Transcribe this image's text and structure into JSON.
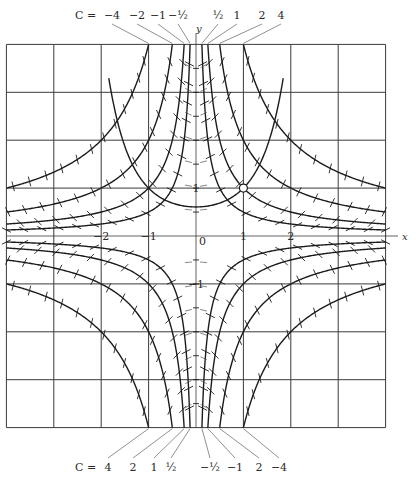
{
  "figure": {
    "colors": {
      "ink": "#1c1c1c",
      "grid": "#3a3a3a",
      "background": "#ffffff"
    },
    "axes": {
      "x_label": "x",
      "y_label": "y",
      "origin_label": "0",
      "x_tick_labels": [
        {
          "value": -2,
          "text": "−2"
        },
        {
          "value": -1,
          "text": "−1"
        },
        {
          "value": 1,
          "text": "1"
        },
        {
          "value": 2,
          "text": "2"
        }
      ],
      "y_tick_labels": [
        {
          "value": 1,
          "text": "1"
        },
        {
          "value": -1,
          "text": "−1"
        }
      ],
      "xlim": [
        -4,
        4
      ],
      "ylim": [
        -4,
        4
      ],
      "grid": true
    },
    "top_labels": {
      "prefix": "C =",
      "items": [
        {
          "text": "−4",
          "c": -4,
          "lx": 112
        },
        {
          "text": "−2",
          "c": -2,
          "lx": 137
        },
        {
          "text": "−1",
          "c": -1,
          "lx": 158
        },
        {
          "text": "−½",
          "c": -0.5,
          "lx": 178
        },
        {
          "text": "½",
          "c": 0.5,
          "lx": 218
        },
        {
          "text": "1",
          "c": 1,
          "lx": 237
        },
        {
          "text": "2",
          "c": 2,
          "lx": 262
        },
        {
          "text": "4",
          "c": 4,
          "lx": 281
        }
      ]
    },
    "bottom_labels": {
      "prefix": "C =",
      "items": [
        {
          "text": "4",
          "c": 4,
          "lx": 108
        },
        {
          "text": "2",
          "c": 2,
          "lx": 133
        },
        {
          "text": "1",
          "c": 1,
          "lx": 154
        },
        {
          "text": "½",
          "c": 0.5,
          "lx": 171
        },
        {
          "text": "−½",
          "c": -0.5,
          "lx": 210
        },
        {
          "text": "−1",
          "c": -1,
          "lx": 235
        },
        {
          "text": "2",
          "c": -2,
          "lx": 259
        },
        {
          "text": "−4",
          "c": -4,
          "lx": 279
        }
      ]
    },
    "marked_point": {
      "x": 1,
      "y": 1,
      "symbol": "open-circle"
    }
  },
  "chart_data": {
    "type": "line",
    "equation": "y' = xy",
    "isocline_family": "xy = C",
    "isocline_values": [
      -4,
      -2,
      -1,
      -0.5,
      0.5,
      1,
      2,
      4
    ],
    "solution_curve": {
      "equation": "y = e^{(x^2-1)/2}",
      "passes_through": [
        [
          -1,
          1
        ],
        [
          1,
          1
        ]
      ],
      "min_point": [
        0,
        0.61
      ]
    },
    "xlabel": "x",
    "ylabel": "y",
    "xlim": [
      -4,
      4
    ],
    "ylim": [
      -4,
      4
    ],
    "x_ticks": [
      -2,
      -1,
      0,
      1,
      2
    ],
    "y_ticks": [
      -1,
      0,
      1
    ],
    "grid": true
  }
}
